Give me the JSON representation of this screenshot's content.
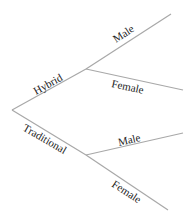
{
  "diagram": {
    "type": "tree",
    "orientation": "left-to-right",
    "colors": {
      "line": "#a8a8a8",
      "text": "#222222",
      "background": "#ffffff"
    },
    "root": {
      "x": 12,
      "y": 110
    },
    "branches": [
      {
        "label": "Hybrid",
        "node": {
          "x": 86,
          "y": 69
        },
        "children": [
          {
            "label": "Male",
            "end": {
              "x": 171,
              "y": 14
            }
          },
          {
            "label": "Female",
            "end": {
              "x": 183,
              "y": 90
            }
          }
        ]
      },
      {
        "label": "Traditional",
        "node": {
          "x": 86,
          "y": 155
        },
        "children": [
          {
            "label": "Male",
            "end": {
              "x": 183,
              "y": 133
            }
          },
          {
            "label": "Female",
            "end": {
              "x": 168,
              "y": 210
            }
          }
        ]
      }
    ]
  }
}
